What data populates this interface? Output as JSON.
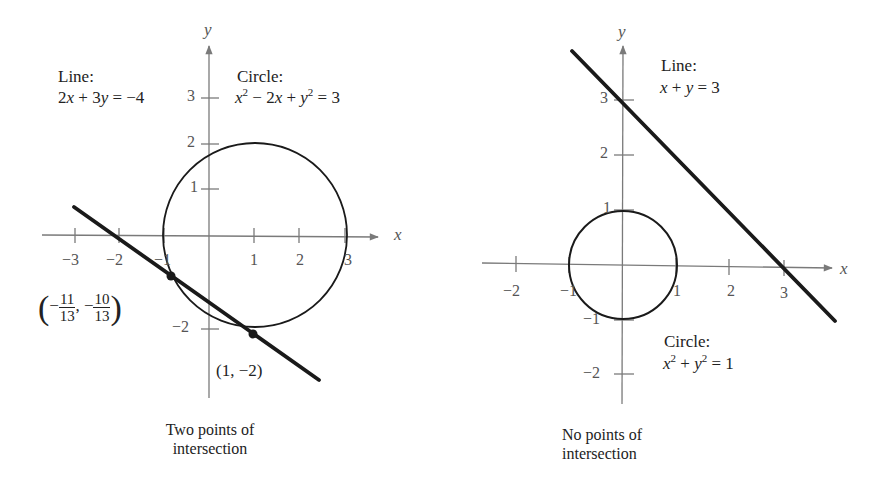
{
  "left_graph": {
    "axis_x_label": "x",
    "axis_y_label": "y",
    "x_ticks": [
      "−3",
      "−2",
      "−1",
      "1",
      "2",
      "3"
    ],
    "y_ticks": [
      "3",
      "2",
      "1",
      "−2"
    ],
    "line_title": "Line:",
    "line_equation": "2x + 3y = −4",
    "circle_title": "Circle:",
    "circle_equation": "x² − 2x + y² = 3",
    "point_a": {
      "label_num_1": "11",
      "label_den_1": "13",
      "label_num_2": "10",
      "label_den_2": "13",
      "text": "(−11/13, −10/13)"
    },
    "point_b": {
      "label": "(1, −2)"
    },
    "caption_line1": "Two points of",
    "caption_line2": "intersection"
  },
  "right_graph": {
    "axis_x_label": "x",
    "axis_y_label": "y",
    "x_ticks": [
      "−2",
      "−1",
      "1",
      "2",
      "3"
    ],
    "y_ticks": [
      "3",
      "2",
      "1",
      "−1",
      "−2"
    ],
    "line_title": "Line:",
    "line_equation": "x + y = 3",
    "circle_title": "Circle:",
    "circle_equation": "x² + y² = 1",
    "caption_line1": "No points of",
    "caption_line2": "intersection"
  },
  "colors": {
    "axis": "#7a7a7a",
    "curve": "#1a1a1a",
    "text": "#222222"
  }
}
